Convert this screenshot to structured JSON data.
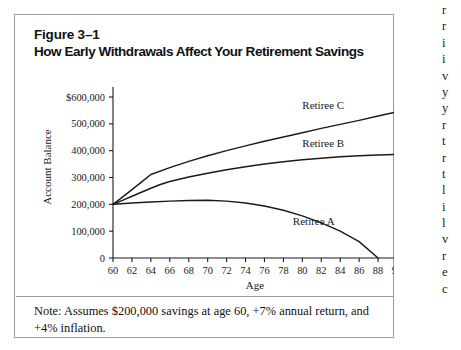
{
  "figure": {
    "label": "Figure 3–1",
    "title": "How Early Withdrawals Affect Your Retirement Savings",
    "note_line1": "Note: Assumes $200,000 savings at age 60, +7% annual return,",
    "note_line2": "and +4% inflation.",
    "border_color": "#9a9a9a"
  },
  "margin_text": {
    "lines": [
      "r",
      "r",
      "i",
      "i",
      "v",
      "y",
      "y",
      "r",
      "t",
      "r",
      "t",
      "l",
      "i",
      "l",
      "v",
      "r",
      "e",
      "c"
    ]
  },
  "chart_data": {
    "type": "line",
    "title": "How Early Withdrawals Affect Your Retirement Savings",
    "xlabel": "Age",
    "ylabel": "Account Balance",
    "xlim": [
      60,
      90
    ],
    "ylim": [
      0,
      600000
    ],
    "grid": false,
    "legend": "inline-labels",
    "xticks": [
      60,
      62,
      64,
      66,
      68,
      70,
      72,
      74,
      76,
      78,
      80,
      82,
      84,
      86,
      88,
      90
    ],
    "xtick_labels": [
      "60",
      "62",
      "64",
      "66",
      "68",
      "70",
      "72",
      "74",
      "76",
      "78",
      "80",
      "82",
      "84",
      "86",
      "88",
      "90"
    ],
    "yticks": [
      0,
      100000,
      200000,
      300000,
      400000,
      500000,
      600000
    ],
    "ytick_labels": [
      "0",
      "100,000",
      "200,000",
      "300,000",
      "400,000",
      "500,000",
      "$600,000"
    ],
    "line_color": "#1a1a1a",
    "series": [
      {
        "name": "Retiree C",
        "label": "Retiree C",
        "x": [
          60,
          61,
          62,
          63,
          64,
          66,
          68,
          70,
          72,
          74,
          76,
          78,
          80,
          82,
          84,
          86,
          88,
          90
        ],
        "values": [
          200000,
          227000,
          255000,
          283000,
          311000,
          337000,
          360000,
          381000,
          400000,
          418000,
          435000,
          451000,
          467000,
          483000,
          498000,
          513000,
          529000,
          545000
        ]
      },
      {
        "name": "Retiree B",
        "label": "Retiree B",
        "x": [
          60,
          61,
          62,
          63,
          64,
          65,
          66,
          68,
          70,
          72,
          74,
          76,
          78,
          80,
          82,
          84,
          86,
          88,
          90
        ],
        "values": [
          200000,
          215000,
          230000,
          245000,
          260000,
          274000,
          285000,
          302000,
          316000,
          329000,
          340000,
          350000,
          359000,
          366000,
          372000,
          377000,
          381000,
          384000,
          386000
        ]
      },
      {
        "name": "Retiree A",
        "label": "Retiree A",
        "x": [
          60,
          62,
          64,
          66,
          68,
          70,
          72,
          74,
          76,
          78,
          80,
          82,
          84,
          86,
          88
        ],
        "values": [
          200000,
          205000,
          209000,
          212000,
          214000,
          215000,
          212000,
          205000,
          194000,
          178000,
          157000,
          131000,
          100000,
          61000,
          0
        ]
      }
    ]
  }
}
